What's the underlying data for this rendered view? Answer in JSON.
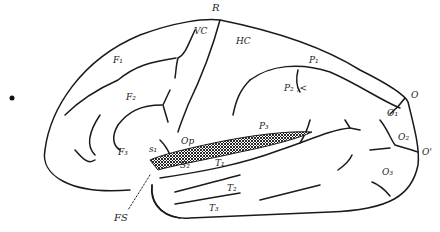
{
  "diagram": {
    "type": "brain lateral view (cerebral hemisphere line drawing)",
    "labels": [
      {
        "id": "R",
        "text": "R",
        "x": 212,
        "y": 3
      },
      {
        "id": "VC",
        "text": "VC",
        "x": 194,
        "y": 30
      },
      {
        "id": "HC",
        "text": "HC",
        "x": 236,
        "y": 40
      },
      {
        "id": "F1",
        "text": "F₁",
        "x": 115,
        "y": 59
      },
      {
        "id": "F2",
        "text": "F₂",
        "x": 126,
        "y": 96
      },
      {
        "id": "F3",
        "text": "F₃",
        "x": 120,
        "y": 151
      },
      {
        "id": "P1",
        "text": "P₁",
        "x": 311,
        "y": 58
      },
      {
        "id": "P2",
        "text": "P₂ ,<",
        "x": 286,
        "y": 86
      },
      {
        "id": "P3",
        "text": "P₃",
        "x": 260,
        "y": 123
      },
      {
        "id": "O",
        "text": "O",
        "x": 412,
        "y": 94
      },
      {
        "id": "O1",
        "text": "O₁",
        "x": 388,
        "y": 111
      },
      {
        "id": "O2",
        "text": "O₂",
        "x": 399,
        "y": 134
      },
      {
        "id": "O_prime",
        "text": "O'",
        "x": 421,
        "y": 151
      },
      {
        "id": "O3",
        "text": "O₃",
        "x": 384,
        "y": 168
      },
      {
        "id": "Op",
        "text": "Op",
        "x": 182,
        "y": 140
      },
      {
        "id": "S1",
        "text": "s₁",
        "x": 149,
        "y": 148
      },
      {
        "id": "S2",
        "text": "S₂",
        "x": 180,
        "y": 162
      },
      {
        "id": "T1",
        "text": "T₁",
        "x": 215,
        "y": 161
      },
      {
        "id": "T2",
        "text": "T₂",
        "x": 228,
        "y": 186
      },
      {
        "id": "T3",
        "text": "T₃",
        "x": 210,
        "y": 205
      },
      {
        "id": "FS",
        "text": "FS",
        "x": 116,
        "y": 214
      }
    ]
  }
}
